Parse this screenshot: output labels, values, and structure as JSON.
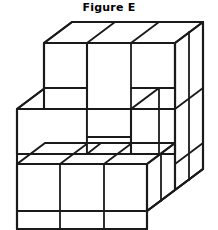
{
  "figure": {
    "title": "Figure E",
    "caption_position": "top-center",
    "background_color": "#ffffff",
    "line_color": "#1a1a1a",
    "face_color": "#ffffff",
    "line_width_px": 2
  },
  "drawing": {
    "type": "isometric-cube-stack",
    "description": "Three-dimensional block figure drawn in oblique/isometric projection showing a stepped arrangement of unit cubes with a recessed notch in the middle tier.",
    "projection": {
      "style": "oblique",
      "depth_dx_px": 28,
      "depth_dy_px": -22,
      "cube_width_px": 49,
      "cube_height_px": 49
    },
    "grid": {
      "columns": 3,
      "rows": 3,
      "layers": 2
    },
    "visible_faces": {
      "top_cells": 3,
      "front_cells_bottom_row": 3,
      "front_cells_middle_row": 2,
      "front_cells_top_row": 3,
      "right_side_cells": 3
    },
    "features": [
      {
        "name": "notch",
        "location": "middle-tier-center",
        "description": "recessed square opening between the two middle front cubes"
      },
      {
        "name": "step",
        "location": "front-middle-tier",
        "description": "middle layer set back revealing top surfaces of bottom cubes"
      }
    ]
  }
}
